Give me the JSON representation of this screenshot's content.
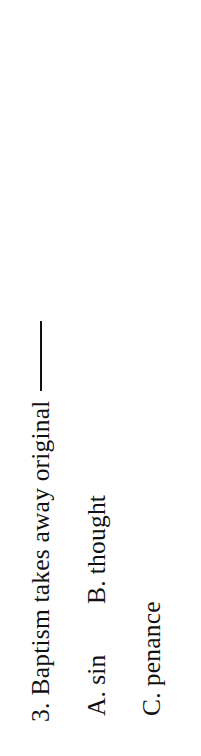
{
  "page": {
    "kind": "scanned-quiz-page",
    "rotation_degrees": -90,
    "background_color": "#ffffff",
    "text_color": "#111111"
  },
  "question": {
    "number": "3.",
    "stem": "Baptism takes away original",
    "blank_rule": "—"
  },
  "options": [
    {
      "label": "A.",
      "text": "sin"
    },
    {
      "label": "B.",
      "text": "thought"
    },
    {
      "label": "C.",
      "text": "penance"
    }
  ]
}
